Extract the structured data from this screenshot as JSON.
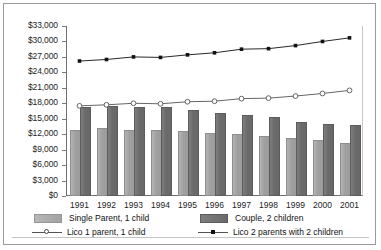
{
  "chart_data": {
    "type": "bar",
    "title": "",
    "xlabel": "",
    "ylabel": "",
    "categories": [
      "1991",
      "1992",
      "1993",
      "1994",
      "1995",
      "1996",
      "1997",
      "1998",
      "1999",
      "2000",
      "2001"
    ],
    "ylim": [
      0,
      33000
    ],
    "ytick_step": 3000,
    "ytick_labels": [
      "$33,000",
      "$30,000",
      "$27,000",
      "$24,000",
      "$21,000",
      "$18,000",
      "$15,000",
      "$12,000",
      "$9,000",
      "$6,000",
      "$3,000",
      "$0"
    ],
    "ytick_values": [
      33000,
      30000,
      27000,
      24000,
      21000,
      18000,
      15000,
      12000,
      9000,
      6000,
      3000,
      0
    ],
    "grid": false,
    "legend_position": "bottom",
    "series": [
      {
        "name": "Single Parent, 1 child",
        "kind": "bar",
        "color": "#a0a0a0",
        "values": [
          12400,
          12800,
          12500,
          12500,
          12300,
          11900,
          11600,
          11200,
          10800,
          10400,
          9900
        ]
      },
      {
        "name": "Couple, 2 children",
        "kind": "bar",
        "color": "#6b6b6b",
        "values": [
          16900,
          17100,
          16800,
          16800,
          16300,
          15700,
          15300,
          14900,
          14000,
          13600,
          13400
        ]
      },
      {
        "name": "Lico 1 parent, 1 child",
        "kind": "line",
        "marker": "open-circle",
        "color": "#555555",
        "values": [
          17500,
          17700,
          18000,
          17900,
          18300,
          18400,
          18900,
          19000,
          19400,
          19900,
          20500
        ]
      },
      {
        "name": "Lico 2 parents with 2 children",
        "kind": "line",
        "marker": "filled-square",
        "color": "#111111",
        "values": [
          26200,
          26500,
          27000,
          26900,
          27400,
          27800,
          28500,
          28600,
          29200,
          30000,
          30700
        ]
      }
    ]
  },
  "legend": {
    "items": [
      {
        "label": "Single Parent, 1 child"
      },
      {
        "label": "Couple, 2 children"
      },
      {
        "label": "Lico 1 parent, 1 child"
      },
      {
        "label": "Lico 2 parents with 2 children"
      }
    ]
  }
}
